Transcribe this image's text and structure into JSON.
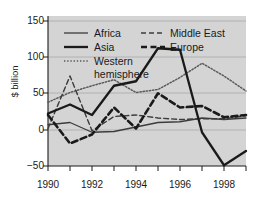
{
  "chart_data": {
    "type": "line",
    "title": "",
    "xlabel": "",
    "ylabel": "$ billion",
    "xlim": [
      1990,
      1999
    ],
    "ylim": [
      -50,
      150
    ],
    "yticks": [
      150,
      100,
      50,
      0,
      -50
    ],
    "ytick_labels": [
      "150",
      "100",
      "50",
      "0",
      "−50"
    ],
    "xticks": [
      1990,
      1991,
      1992,
      1993,
      1994,
      1995,
      1996,
      1997,
      1998,
      1999
    ],
    "xtick_labels": [
      "1990",
      "",
      "1992",
      "",
      "1994",
      "",
      "1996",
      "",
      "1998",
      ""
    ],
    "grid": "horizontal",
    "legend_position": "top-left-inside",
    "x": [
      1990,
      1991,
      1992,
      1993,
      1994,
      1995,
      1996,
      1997,
      1998,
      1999
    ],
    "series": [
      {
        "name": "Africa",
        "style": "thin-solid",
        "color": "#3c3c3c",
        "values": [
          5,
          8,
          -5,
          -4,
          2,
          8,
          9,
          14,
          12,
          14
        ]
      },
      {
        "name": "Asia",
        "style": "thick-solid",
        "color": "#1a1a1a",
        "values": [
          20,
          32,
          18,
          57,
          63,
          107,
          105,
          -5,
          -49,
          -30
        ]
      },
      {
        "name": "Western hemisphere",
        "style": "dotted",
        "color": "#5a5a5a",
        "values": [
          35,
          48,
          57,
          65,
          48,
          52,
          68,
          87,
          70,
          50
        ]
      },
      {
        "name": "Middle East",
        "style": "thin-dashed",
        "color": "#3c3c3c",
        "values": [
          0,
          70,
          -3,
          16,
          18,
          14,
          12,
          13,
          13,
          17
        ]
      },
      {
        "name": "Europe",
        "style": "thick-dashed",
        "color": "#1a1a1a",
        "values": [
          18,
          -20,
          -8,
          28,
          0,
          47,
          28,
          30,
          15,
          18
        ]
      }
    ]
  },
  "axes": {
    "y_label": "$ billion",
    "y_ticks": [
      "150",
      "100",
      "50",
      "0",
      "−50"
    ],
    "x_ticks": [
      "1990",
      "1992",
      "1994",
      "1996",
      "1998"
    ]
  },
  "legend": {
    "entries": [
      {
        "label": "Africa",
        "style": "thin-solid"
      },
      {
        "label": "Middle East",
        "style": "thin-dashed"
      },
      {
        "label": "Asia",
        "style": "thick-solid"
      },
      {
        "label": "Europe",
        "style": "thick-dashed"
      },
      {
        "label": "Western",
        "style": "dotted"
      },
      {
        "label": "hemisphere",
        "style": "none"
      }
    ]
  },
  "colors": {
    "plot_background": "#d4d4d4",
    "page_background": "#ffffff",
    "line_dark": "#1a1a1a",
    "line_mid": "#3c3c3c",
    "grid": "#a8a8a8"
  }
}
